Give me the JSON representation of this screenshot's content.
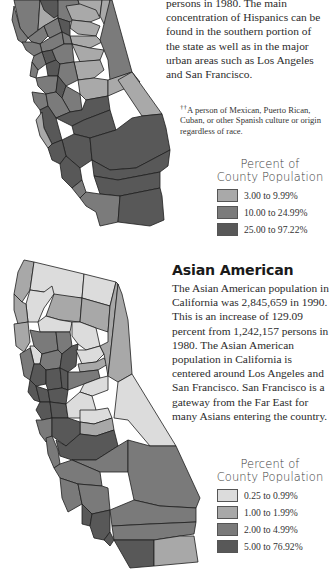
{
  "hispanic": {
    "body_text": "persons in 1980. The main concentration of Hispanics can be found in the southern portion of the state as well as in the major urban areas such as Los Angeles and San Francisco.",
    "footnote_mark": "††",
    "footnote_text": "A person of Mexican, Puerto Rican, Cuban, or other Spanish culture or origin regardless of race.",
    "legend": {
      "title_line1": "Percent of",
      "title_line2": "County Population",
      "items": [
        {
          "label": "3.00 to 9.99%",
          "color": "#a9a9a9"
        },
        {
          "label": "10.00 to 24.99%",
          "color": "#7b7b7b"
        },
        {
          "label": "25.00 to 97.22%",
          "color": "#585858"
        }
      ]
    }
  },
  "asian": {
    "heading": "Asian American",
    "body_text": "The Asian American population in California was 2,845,659 in 1990. This is an increase of 129.09 percent from 1,242,157 persons in 1980. The Asian American population in California is centered around Los Angeles and San Francisco. San Francisco is a gateway from the Far East for many Asians entering the country.",
    "legend": {
      "title_line1": "Percent of",
      "title_line2": "County Population",
      "items": [
        {
          "label": "0.25 to 0.99%",
          "color": "#dcdcdc"
        },
        {
          "label": "1.00 to 1.99%",
          "color": "#a8a8a8"
        },
        {
          "label": "2.00 to 4.99%",
          "color": "#7a7a7a"
        },
        {
          "label": "5.00 to 76.92%",
          "color": "#585858"
        }
      ]
    }
  }
}
